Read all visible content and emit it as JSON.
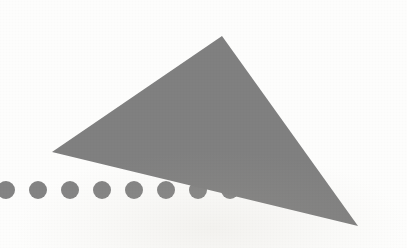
{
  "canvas": {
    "width": 407,
    "height": 248,
    "background_color": "#fdfdfc",
    "title": "Abstract geometric figure"
  },
  "palette": {
    "shape_gray": "#808080",
    "dot_gray": "#838383",
    "background": "#fdfdfc",
    "edge_soft_gray": "#9a9a9a"
  },
  "chart_data": {
    "type": "scatter",
    "xlabel": "",
    "ylabel": "",
    "xlim": [
      0,
      407
    ],
    "ylim": [
      0,
      248
    ],
    "grid": false,
    "legend_position": "none",
    "tick_labels_x": [],
    "tick_labels_y": [],
    "annotations": [],
    "shapes": [
      {
        "name": "triangle",
        "kind": "polygon",
        "fill": "#808080",
        "stroke": "none",
        "points": [
          {
            "x": 222,
            "y": 36
          },
          {
            "x": 52,
            "y": 152
          },
          {
            "x": 358,
            "y": 226
          }
        ],
        "point_labels": [
          "apex-top",
          "vertex-left",
          "vertex-bottom-right"
        ]
      }
    ],
    "series": [
      {
        "name": "dot-row",
        "kind": "circles",
        "fill": "#838383",
        "radius": 9,
        "x": [
          6,
          38,
          70,
          102,
          134,
          166,
          198,
          230
        ],
        "y": [
          190,
          190,
          190,
          190,
          190,
          190,
          190,
          190
        ],
        "values": [
          190,
          190,
          190,
          190,
          190,
          190,
          190,
          190
        ],
        "spacing": 32,
        "count": 8
      }
    ]
  }
}
